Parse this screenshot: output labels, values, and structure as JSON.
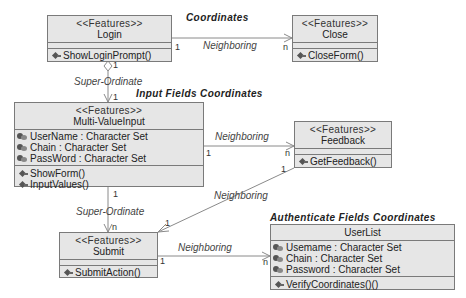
{
  "diagram": {
    "type": "UML class diagram",
    "group_labels": {
      "coordinates": "Coordinates",
      "input_fields": "Input Fields Coordinates",
      "authenticate_fields": "Authenticate Fields Coordinates"
    },
    "classes": {
      "login": {
        "stereotype": "<<Features>>",
        "name": "Login",
        "attributes": [],
        "operations": [
          "ShowLoginPrompt()"
        ]
      },
      "close": {
        "stereotype": "<<Features>>",
        "name": "Close",
        "attributes": [],
        "operations": [
          "CloseForm()"
        ]
      },
      "multi_value_input": {
        "stereotype": "<<Features>>",
        "name": "Multi-ValueInput",
        "attributes": [
          "UserName : Character Set",
          "Chain : Character Set",
          "PassWord : Character Set"
        ],
        "operations": [
          "ShowForm()",
          "InputValues()"
        ]
      },
      "feedback": {
        "stereotype": "<<Features>>",
        "name": "Feedback",
        "attributes": [],
        "operations": [
          "GetFeedback()"
        ]
      },
      "submit": {
        "stereotype": "<<Features>>",
        "name": "Submit",
        "attributes": [],
        "operations": [
          "SubmitAction()"
        ]
      },
      "user_list": {
        "name": "UserList",
        "attributes": [
          "Usemame : Character Set",
          "Chain : Character Set",
          "Password : Character Set"
        ],
        "operations": [
          "VerifyCoordinates()()"
        ]
      }
    },
    "associations": {
      "login_close": {
        "label": "Neighboring",
        "from_mult": "1",
        "to_mult": "n"
      },
      "login_mvi": {
        "label": "Super-Ordinate",
        "from_mult": "1",
        "to_mult": "1"
      },
      "mvi_feedback": {
        "label": "Neighboring",
        "from_mult": "1",
        "to_mult": "n"
      },
      "feedback_submit": {
        "label": "Neighboring",
        "from_mult": "1",
        "to_mult": "1"
      },
      "mvi_submit": {
        "label": "Super-Ordinate",
        "from_mult": "1",
        "to_mult": "n"
      },
      "submit_userlist": {
        "label": "Neighboring",
        "from_mult": "1",
        "to_mult": "n"
      }
    },
    "colors": {
      "class_fill": "#e6e6e6",
      "class_border": "#7a7a7a",
      "line": "#8a8a8a"
    }
  }
}
